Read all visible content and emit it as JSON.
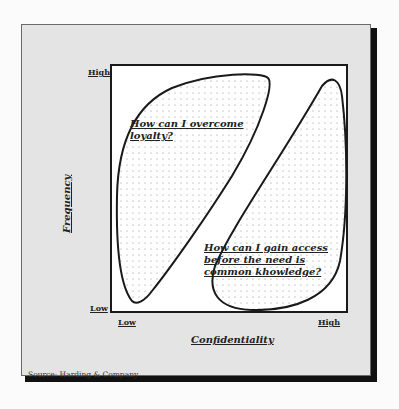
{
  "figure": {
    "y_axis": {
      "title": "Frequency",
      "high_label": "High",
      "low_label": "Low"
    },
    "x_axis": {
      "title": "Confidentiality",
      "low_label": "Low",
      "high_label": "High"
    },
    "regions": [
      {
        "id": "upper-left",
        "position": "high frequency / low confidentiality",
        "question_lines": [
          "How can I overcome",
          "loyalty?"
        ]
      },
      {
        "id": "lower-right",
        "position": "low frequency / high confidentiality",
        "question_lines": [
          "How can I gain access",
          "before the need is",
          "common khowledge?"
        ]
      }
    ],
    "source": "Source:  Harding & Company"
  },
  "colors": {
    "panel": "#e4e4e4",
    "shadow": "#111111",
    "plot_bg": "#ffffff",
    "outline": "#1a1a1a"
  }
}
